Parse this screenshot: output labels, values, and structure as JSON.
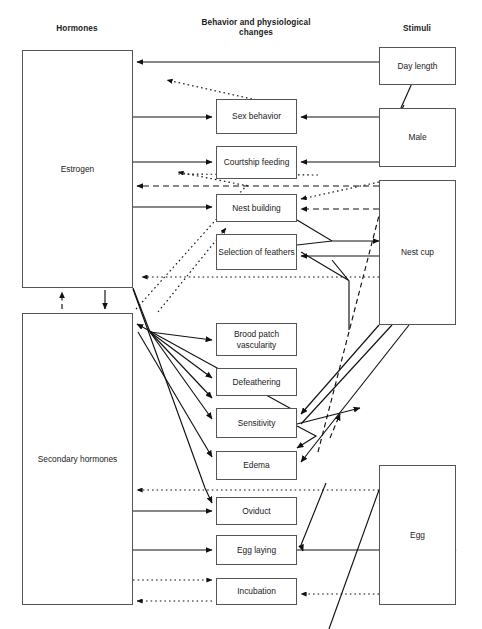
{
  "figure": {
    "type": "flow-diagram",
    "title": "",
    "columns": [
      {
        "id": "hormones",
        "label": "Hormones",
        "x": 77,
        "y": 24
      },
      {
        "id": "behavior",
        "label": "Behavior and physiological changes",
        "x": 255,
        "y": 18
      },
      {
        "id": "stimuli",
        "label": "Stimuli",
        "x": 417,
        "y": 24
      }
    ],
    "nodes": [
      {
        "id": "estrogen",
        "label": "Estrogen",
        "column": "hormones",
        "x": 22,
        "y": 50,
        "w": 111,
        "h": 238
      },
      {
        "id": "secondary",
        "label": "Secondary hormones",
        "column": "hormones",
        "x": 22,
        "y": 313,
        "w": 111,
        "h": 292
      },
      {
        "id": "sex",
        "label": "Sex behavior",
        "column": "behavior",
        "x": 216,
        "y": 99,
        "w": 81,
        "h": 35
      },
      {
        "id": "courtship",
        "label": "Courtship feeding",
        "column": "behavior",
        "x": 216,
        "y": 146,
        "w": 81,
        "h": 33
      },
      {
        "id": "nestbuild",
        "label": "Nest building",
        "column": "behavior",
        "x": 216,
        "y": 194,
        "w": 81,
        "h": 28
      },
      {
        "id": "feathers",
        "label": "Selection of feathers",
        "column": "behavior",
        "x": 216,
        "y": 234,
        "w": 81,
        "h": 36
      },
      {
        "id": "broodpatch",
        "label": "Brood patch vascularity",
        "column": "behavior",
        "x": 216,
        "y": 323,
        "w": 81,
        "h": 33
      },
      {
        "id": "defeather",
        "label": "Defeathering",
        "column": "behavior",
        "x": 216,
        "y": 368,
        "w": 81,
        "h": 28
      },
      {
        "id": "sensitivity",
        "label": "Sensitivity",
        "column": "behavior",
        "x": 216,
        "y": 408,
        "w": 81,
        "h": 30
      },
      {
        "id": "edema",
        "label": "Edema",
        "column": "behavior",
        "x": 216,
        "y": 451,
        "w": 81,
        "h": 29
      },
      {
        "id": "oviduct",
        "label": "Oviduct",
        "column": "behavior",
        "x": 216,
        "y": 497,
        "w": 81,
        "h": 28
      },
      {
        "id": "egglaying",
        "label": "Egg laying",
        "column": "behavior",
        "x": 216,
        "y": 535,
        "w": 81,
        "h": 30
      },
      {
        "id": "incubation",
        "label": "Incubation",
        "column": "behavior",
        "x": 216,
        "y": 578,
        "w": 81,
        "h": 27
      },
      {
        "id": "daylength",
        "label": "Day length",
        "column": "stimuli",
        "x": 379,
        "y": 47,
        "w": 77,
        "h": 38
      },
      {
        "id": "male",
        "label": "Male",
        "column": "stimuli",
        "x": 379,
        "y": 108,
        "w": 77,
        "h": 59
      },
      {
        "id": "nestcup",
        "label": "Nest cup",
        "column": "stimuli",
        "x": 379,
        "y": 180,
        "w": 77,
        "h": 145
      },
      {
        "id": "egg",
        "label": "Egg",
        "column": "stimuli",
        "x": 379,
        "y": 465,
        "w": 77,
        "h": 140
      }
    ],
    "edge_styles": {
      "solid": "solid",
      "dashed": "dashed",
      "dotted": "dotted"
    },
    "edges": [
      {
        "from": "daylength",
        "to": "estrogen",
        "style": "solid"
      },
      {
        "from": "daylength",
        "to": "male",
        "style": "solid"
      },
      {
        "from": "sex",
        "to": "estrogen",
        "style": "dotted"
      },
      {
        "from": "estrogen",
        "to": "sex",
        "style": "solid"
      },
      {
        "from": "male",
        "to": "sex",
        "style": "solid"
      },
      {
        "from": "estrogen",
        "to": "courtship",
        "style": "solid"
      },
      {
        "from": "male",
        "to": "courtship",
        "style": "solid"
      },
      {
        "from": "nestcup",
        "to": "estrogen",
        "style": "dashed"
      },
      {
        "from": "estrogen",
        "to": "nestbuild",
        "style": "solid"
      },
      {
        "from": "nestcup",
        "to": "nestbuild",
        "style": "dashed"
      },
      {
        "from": "nestcup",
        "to": "nestbuild",
        "style": "dotted"
      },
      {
        "from": "nestbuild",
        "to": "nestcup",
        "style": "solid"
      },
      {
        "from": "feathers",
        "to": "nestcup",
        "style": "solid"
      },
      {
        "from": "nestcup",
        "to": "feathers",
        "style": "solid"
      },
      {
        "from": "courtship",
        "to": "estrogen",
        "style": "dotted"
      },
      {
        "from": "nestbuild",
        "to": "estrogen",
        "style": "dotted"
      },
      {
        "from": "nestcup",
        "to": "estrogen",
        "style": "dotted"
      },
      {
        "from": "estrogen",
        "to": "secondary",
        "style": "solid"
      },
      {
        "from": "secondary",
        "to": "estrogen",
        "style": "dashed"
      },
      {
        "from": "secondary",
        "to": "broodpatch",
        "style": "solid"
      },
      {
        "from": "secondary",
        "to": "defeather",
        "style": "solid"
      },
      {
        "from": "secondary",
        "to": "sensitivity",
        "style": "solid"
      },
      {
        "from": "secondary",
        "to": "edema",
        "style": "solid"
      },
      {
        "from": "nestcup",
        "to": "sensitivity",
        "style": "solid"
      },
      {
        "from": "nestcup",
        "to": "edema",
        "style": "solid"
      },
      {
        "from": "sensitivity",
        "to": "secondary",
        "style": "solid"
      },
      {
        "from": "egg",
        "to": "secondary",
        "style": "dotted"
      },
      {
        "from": "secondary",
        "to": "oviduct",
        "style": "solid"
      },
      {
        "from": "secondary",
        "to": "egglaying",
        "style": "solid"
      },
      {
        "from": "egglaying",
        "to": "egg",
        "style": "solid"
      },
      {
        "from": "secondary",
        "to": "incubation",
        "style": "dotted"
      },
      {
        "from": "egg",
        "to": "incubation",
        "style": "dotted"
      },
      {
        "from": "incubation",
        "to": "secondary",
        "style": "dotted"
      }
    ]
  }
}
